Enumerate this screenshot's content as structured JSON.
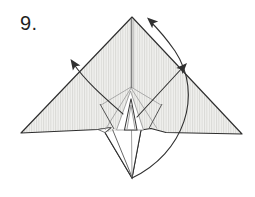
{
  "step": {
    "label": "9."
  },
  "diagram": {
    "kind": "origami-fold-step",
    "paper": {
      "texture": "vertical-hatch",
      "regions": [
        "left-wing",
        "right-wing",
        "center-head-flap",
        "lower-tail-point"
      ]
    },
    "arrows": [
      {
        "name": "left-fold-arrow",
        "shape": "curved",
        "points": "up-left"
      },
      {
        "name": "right-fold-arrow",
        "shape": "straight",
        "points": "up-right"
      },
      {
        "name": "sweep-fold-arrow",
        "shape": "large-arc",
        "points": "from bottom tail tip up to top apex"
      }
    ],
    "colors": {
      "background": "#ffffff",
      "paper_base": "#f1f1ef",
      "hatch_line": "#d9d9d6",
      "outline": "#2e2e2e",
      "fold_line": "#999999",
      "fold_line_dark": "#555555",
      "arrow": "#303030",
      "label": "#1f1f1f"
    }
  }
}
